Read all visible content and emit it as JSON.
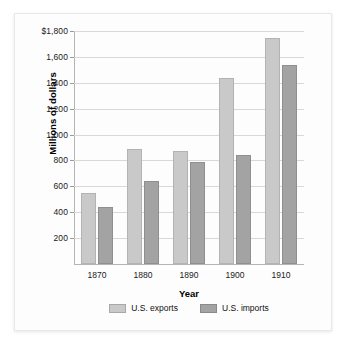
{
  "chart_data": {
    "type": "bar",
    "title": "",
    "xlabel": "Year",
    "ylabel": "Millions of dollars",
    "categories": [
      "1870",
      "1880",
      "1890",
      "1900",
      "1910"
    ],
    "series": [
      {
        "name": "U.S. exports",
        "color": "#c9c9c9",
        "values": [
          545,
          890,
          870,
          1440,
          1745
        ]
      },
      {
        "name": "U.S. imports",
        "color": "#a3a3a3",
        "values": [
          440,
          645,
          790,
          840,
          1540
        ]
      }
    ],
    "ylim": [
      0,
      1800
    ],
    "ytick_values": [
      200,
      400,
      600,
      800,
      1000,
      1200,
      1400,
      1600,
      1800
    ],
    "ytick_labels": [
      "200",
      "400",
      "600",
      "800",
      "1,000",
      "1,200",
      "1,400",
      "1,600",
      "$1,800"
    ],
    "grid": true,
    "legend_position": "bottom"
  }
}
